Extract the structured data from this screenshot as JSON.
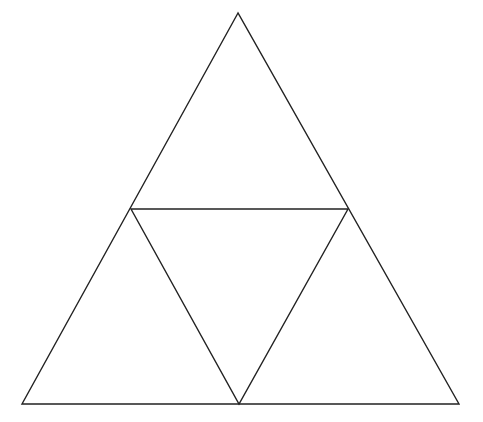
{
  "diagram": {
    "type": "subdivided-triangle",
    "stroke_color": "#222222",
    "background": "#ffffff",
    "vertices": {
      "apex": [
        238,
        13
      ],
      "bottom_left": [
        22,
        404
      ],
      "bottom_right": [
        459,
        404
      ],
      "mid_left": [
        131,
        209
      ],
      "mid_right": [
        348,
        209
      ],
      "mid_bottom": [
        239,
        404
      ]
    }
  }
}
